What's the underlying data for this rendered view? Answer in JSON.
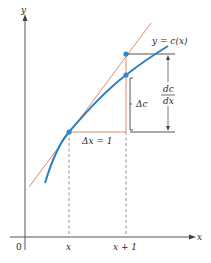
{
  "diagram": {
    "type": "derivative-approximation",
    "axes": {
      "x_label": "x",
      "y_label": "y",
      "origin_label": "0"
    },
    "tick_labels": {
      "x": "x",
      "x_plus_1": "x + 1"
    },
    "annotations": {
      "curve_label": "y = c(x)",
      "delta_x": "Δx = 1",
      "delta_c": "Δc",
      "derivative_num": "dc",
      "derivative_den": "dx"
    },
    "colors": {
      "curve": "#2a7fc0",
      "tangent": "#e08a6e",
      "triangle": "#e08a6e",
      "points": "#2a8ad0",
      "axes": "#555555",
      "guides": "#555555"
    }
  }
}
